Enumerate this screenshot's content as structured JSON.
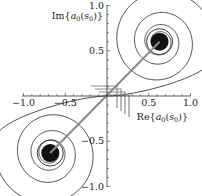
{
  "chart_data": {
    "type": "line",
    "title": "",
    "xlabel": "Re{a0(s0)}",
    "ylabel": "Im{a0(s0)}",
    "xlim": [
      -1.0,
      1.0
    ],
    "ylim": [
      -1.0,
      1.0
    ],
    "grid": false,
    "legend": null,
    "x_ticks": [
      "-1.0",
      "-0.5",
      "0.5",
      "1.0"
    ],
    "y_ticks": [
      "1.0",
      "0.5",
      "-0.5",
      "-1.0"
    ],
    "series": [
      {
        "name": "spiral (upper)",
        "description": "curve spirals from origin along x-axis outward, then winds inward toward a limit point",
        "center": [
          0.63,
          0.6
        ],
        "color": "#222222"
      },
      {
        "name": "spiral (lower)",
        "description": "point-symmetric counterpart spiraling into lower-left limit point",
        "center": [
          -0.68,
          -0.63
        ],
        "color": "#222222"
      },
      {
        "name": "straight segment",
        "description": "gray line connecting the two spiral centers through the origin",
        "points": [
          [
            -0.68,
            -0.63
          ],
          [
            0.63,
            0.6
          ]
        ],
        "color": "#888888"
      },
      {
        "name": "staircase near origin",
        "description": "gray step segments near origin",
        "color": "#888888"
      }
    ]
  }
}
